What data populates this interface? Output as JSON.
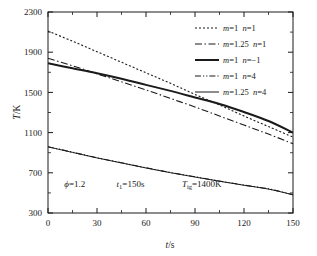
{
  "chart_data": {
    "type": "line",
    "title": "",
    "xlabel": "t/s",
    "ylabel": "T/K",
    "xlim": [
      0,
      150
    ],
    "ylim": [
      300,
      2300
    ],
    "xticks": [
      0,
      30,
      60,
      90,
      120,
      150
    ],
    "xticklabels": [
      "0",
      "30",
      "60",
      "90",
      "120",
      "150"
    ],
    "yticks": [
      300,
      700,
      1100,
      1500,
      1900,
      2300
    ],
    "yticklabels": [
      "300",
      "700",
      "1100",
      "1500",
      "1900",
      "2300"
    ],
    "xminorticks": [
      15,
      45,
      75,
      105,
      135
    ],
    "yminorticks": [
      500,
      900,
      1300,
      1700,
      2100
    ],
    "grid": false,
    "legend_position": "top-right",
    "series": [
      {
        "name": "m=1  n=1",
        "label_m": "m",
        "label_m_val": "=1",
        "label_n": "n",
        "label_n_val": "=1",
        "style": "dotted",
        "color": "#1a1a1a",
        "width": 1.1,
        "x": [
          0,
          15,
          30,
          45,
          60,
          75,
          90,
          105,
          120,
          135,
          150
        ],
        "y": [
          2110,
          2010,
          1905,
          1800,
          1695,
          1590,
          1480,
          1375,
          1265,
          1160,
          1055
        ]
      },
      {
        "name": "m=1.25  n=1",
        "label_m": "m",
        "label_m_val": "=1.25",
        "label_n": "n",
        "label_n_val": "=1",
        "style": "dashdot",
        "color": "#1a1a1a",
        "width": 1.1,
        "x": [
          0,
          15,
          30,
          45,
          60,
          75,
          90,
          105,
          120,
          135,
          150
        ],
        "y": [
          1840,
          1765,
          1685,
          1605,
          1525,
          1440,
          1355,
          1265,
          1175,
          1085,
          990
        ]
      },
      {
        "name": "m=1  n=-1",
        "label_m": "m",
        "label_m_val": "=1",
        "label_n": "n",
        "label_n_val": "=−1",
        "style": "solid",
        "color": "#1a1a1a",
        "width": 2.0,
        "x": [
          0,
          15,
          30,
          45,
          60,
          75,
          90,
          105,
          120,
          135,
          150
        ],
        "y": [
          1790,
          1740,
          1690,
          1635,
          1575,
          1515,
          1450,
          1385,
          1305,
          1215,
          1100
        ]
      },
      {
        "name": "m=1  n=4",
        "label_m": "m",
        "label_m_val": "=1",
        "label_n": "n",
        "label_n_val": "=4",
        "style": "dashdotdot",
        "color": "#1a1a1a",
        "width": 1.1,
        "x": [
          0,
          15,
          30,
          45,
          60,
          75,
          90,
          105,
          120,
          135,
          150
        ],
        "y": [
          960,
          905,
          850,
          800,
          750,
          703,
          660,
          618,
          578,
          540,
          483
        ]
      },
      {
        "name": "m=1.25  n=4",
        "label_m": "m",
        "label_m_val": "=1.25",
        "label_n": "n",
        "label_n_val": "=4",
        "style": "solid-thin",
        "color": "#1a1a1a",
        "width": 1.0,
        "x": [
          0,
          15,
          30,
          45,
          60,
          75,
          90,
          105,
          120,
          135,
          150
        ],
        "y": [
          958,
          903,
          848,
          798,
          748,
          701,
          658,
          616,
          576,
          538,
          481
        ]
      }
    ],
    "annotations": [
      {
        "name": "equivalence-ratio",
        "symbol": "ϕ",
        "sub": "",
        "value": "=1.2",
        "x": 10,
        "y": 560
      },
      {
        "name": "burn-time",
        "symbol": "t",
        "sub": "1",
        "value": "=150s",
        "x": 42,
        "y": 560
      },
      {
        "name": "ignition-temperature",
        "symbol": "T",
        "sub": "ig",
        "value": "=1400K",
        "x": 82,
        "y": 560
      }
    ]
  },
  "axes": {
    "y_axis_title": "T/K",
    "y_axis_title_symbol": "T",
    "y_axis_title_unit": "/K",
    "x_axis_title_symbol": "t",
    "x_axis_title_unit": "/s"
  }
}
